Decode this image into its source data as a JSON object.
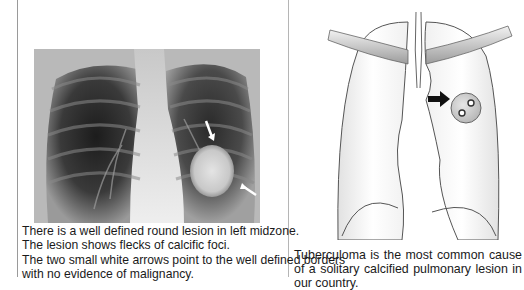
{
  "left_panel": {
    "figure": {
      "type": "chest-xray",
      "annotations": [
        "white-arrow-upper",
        "white-arrow-lower"
      ],
      "lesion": "round-lesion-left-midzone"
    },
    "caption_lines": [
      "There is a well defined round lesion in left midzone.",
      "The lesion shows flecks of calcific foci.",
      "The two small white arrows point to the well defined borders",
      "with no evidence of malignancy."
    ]
  },
  "right_panel": {
    "figure": {
      "type": "lung-diagram",
      "annotations": [
        "black-arrow"
      ],
      "lesion": "calcified-nodule"
    },
    "caption": "Tuberculoma is the most common cause of a solitary calcified pulmonary lesion in our country."
  },
  "colors": {
    "border": "#9a9a9a",
    "text": "#1a1a1a",
    "lung_outline": "#555555",
    "lung_fill": "#f4f4f4",
    "lesion_fill": "#cfcfcf"
  }
}
